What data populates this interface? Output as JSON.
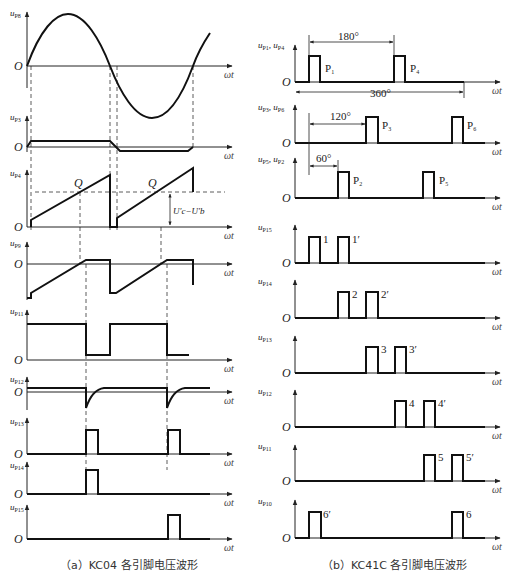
{
  "panel_a": {
    "caption": "（a）KC04 各引脚电压波形",
    "axis_x_label": "ωt",
    "origin_label": "O",
    "traces": [
      {
        "id": "uP8",
        "label": "u",
        "sub": "P8"
      },
      {
        "id": "uP3",
        "label": "u",
        "sub": "P3"
      },
      {
        "id": "uP4",
        "label": "u",
        "sub": "P4"
      },
      {
        "id": "uP9",
        "label": "u",
        "sub": "P9"
      },
      {
        "id": "uP11",
        "label": "u",
        "sub": "P11"
      },
      {
        "id": "uP12",
        "label": "u",
        "sub": "P12"
      },
      {
        "id": "uP13",
        "label": "u",
        "sub": "P13"
      },
      {
        "id": "uP14",
        "label": "u",
        "sub": "P14"
      },
      {
        "id": "uP15",
        "label": "u",
        "sub": "P15"
      }
    ],
    "q_label": "Q",
    "voltage_diff_label": "U′c−U′b"
  },
  "panel_b": {
    "caption": "（b）KC41C 各引脚电压波形",
    "axis_x_label": "ωt",
    "origin_label": "O",
    "traces": [
      {
        "id": "uP1P4",
        "label": "u",
        "sub": "P1",
        "label2": "u",
        "sub2": "P4",
        "pulses": [
          "P1",
          "P4"
        ]
      },
      {
        "id": "uP3P6",
        "label": "u",
        "sub": "P3",
        "label2": "u",
        "sub2": "P6",
        "pulses": [
          "P3",
          "P6"
        ]
      },
      {
        "id": "uP5P2",
        "label": "u",
        "sub": "P5",
        "label2": "u",
        "sub2": "P2",
        "pulses": [
          "P2",
          "P5"
        ]
      },
      {
        "id": "uP15",
        "label": "u",
        "sub": "P15",
        "pulses": [
          "1",
          "1′"
        ]
      },
      {
        "id": "uP14",
        "label": "u",
        "sub": "P14",
        "pulses": [
          "2",
          "2′"
        ]
      },
      {
        "id": "uP13",
        "label": "u",
        "sub": "P13",
        "pulses": [
          "3",
          "3′"
        ]
      },
      {
        "id": "uP12",
        "label": "u",
        "sub": "P12",
        "pulses": [
          "4",
          "4′"
        ]
      },
      {
        "id": "uP11",
        "label": "u",
        "sub": "P11",
        "pulses": [
          "5",
          "5′"
        ]
      },
      {
        "id": "uP10",
        "label": "u",
        "sub": "P10",
        "pulses": [
          "6′",
          "6"
        ]
      }
    ],
    "angles": {
      "a180": "180°",
      "a360": "360°",
      "a120": "120°",
      "a60": "60°"
    }
  }
}
